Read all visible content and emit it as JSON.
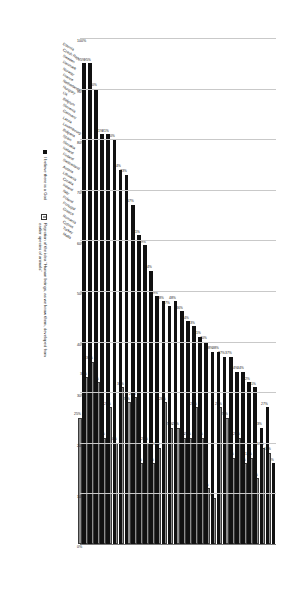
{
  "chart_data": {
    "type": "bar",
    "title": "",
    "subtitle": "",
    "xlabel": "",
    "ylabel": "",
    "orientation": "horizontal",
    "grid": true,
    "legend_position": "bottom-right",
    "axis_ticks": [
      "100%",
      "90%",
      "80%",
      "70%",
      "60%",
      "50%",
      "40%",
      "30%",
      "20%",
      "10%",
      "0%"
    ],
    "xlim": [
      0,
      100
    ],
    "categories": [
      "Estonia",
      "Czech Rep",
      "Sweden",
      "Denmark",
      "Norway",
      "France",
      "Netherlands",
      "Hungary",
      "UK",
      "Belgium",
      "Slovenia",
      "Germany",
      "Latvia",
      "Luxembourg",
      "Bulgaria",
      "Spain",
      "Slovakia",
      "Iceland",
      "Finland",
      "Switzerland",
      "Austria",
      "Lithuania",
      "Croatia",
      "Ireland",
      "Italy",
      "Poland",
      "Portugal",
      "Greece",
      "Romania",
      "Cyprus",
      "Turkey",
      "Malta"
    ],
    "series": [
      {
        "name": "I believe there is a God",
        "color": "#111111",
        "values": [
          16,
          27,
          23,
          31,
          32,
          34,
          34,
          37,
          37,
          38,
          38,
          40,
          41,
          43,
          44,
          46,
          48,
          47,
          48,
          49,
          54,
          59,
          61,
          67,
          73,
          74,
          80,
          81,
          81,
          90,
          95,
          95
        ],
        "labels": [
          "16%",
          "27%",
          "23%",
          "31%",
          "32%",
          "34%",
          "34%",
          "37%",
          "37%",
          "38%",
          "38%",
          "40%",
          "41%",
          "43%",
          "44%",
          "46%",
          "48%",
          "47%",
          "48%",
          "49%",
          "54%",
          "59%",
          "61%",
          "67%",
          "73%",
          "74%",
          "80%",
          "81%",
          "81%",
          "90%",
          "95%",
          "95%"
        ]
      },
      {
        "name": "Rejection of the idea \"Human beings, as we know them, developed from earlier species of animals\"",
        "color": "#8d8d8d",
        "values": [
          18,
          19,
          13,
          17,
          16,
          21,
          17,
          25,
          27,
          9,
          11,
          21,
          27,
          21,
          21,
          23,
          23,
          28,
          19,
          16,
          20,
          16,
          29,
          28,
          31,
          20,
          27,
          21,
          32,
          36,
          33,
          25
        ],
        "labels": [
          "18%",
          "19%",
          "13%",
          "17%",
          "16%",
          "21%",
          "17%",
          "25%",
          "27%",
          "9%",
          "11%",
          "21%",
          "27%",
          "21%",
          "21%",
          "23%",
          "23%",
          "28%",
          "19%",
          "16%",
          "20%",
          "16%",
          "29%",
          "28%",
          "31%",
          "20%",
          "27%",
          "21%",
          "32%",
          "36%",
          "33%",
          "25%"
        ]
      }
    ]
  },
  "legend": {
    "items": [
      {
        "label": "I believe there is a God",
        "marker": "filled-square-black"
      },
      {
        "label": "Rejection of the idea \"Human beings, as we know them, developed from earlier species of animals\"",
        "marker": "outlined-square-gray"
      }
    ]
  }
}
